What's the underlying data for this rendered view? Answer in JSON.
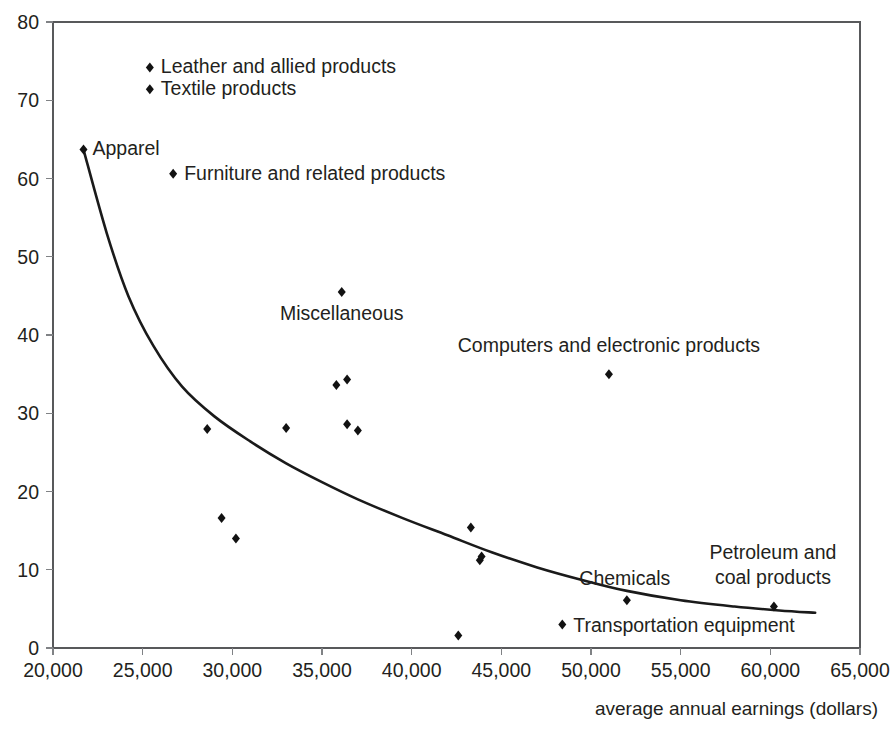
{
  "chart_data": {
    "type": "scatter",
    "title": "",
    "subtitle": "",
    "xlabel": "average annual earnings (dollars)",
    "ylabel": "",
    "xlim": [
      20000,
      65000
    ],
    "ylim": [
      0,
      80
    ],
    "xticks": [
      20000,
      25000,
      30000,
      35000,
      40000,
      45000,
      50000,
      55000,
      60000,
      65000
    ],
    "xtick_labels": [
      "20,000",
      "25,000",
      "30,000",
      "35,000",
      "40,000",
      "45,000",
      "50,000",
      "55,000",
      "60,000",
      "65,000"
    ],
    "yticks": [
      0,
      10,
      20,
      30,
      40,
      50,
      60,
      70,
      80
    ],
    "ytick_labels": [
      "0",
      "10",
      "20",
      "30",
      "40",
      "50",
      "60",
      "70",
      "80"
    ],
    "grid": false,
    "legend": false,
    "marker": "diamond",
    "marker_color": "#121212",
    "trendline": {
      "present": true,
      "color": "#1a1a1a",
      "style": "solid-decay-curve",
      "description": "smooth decreasing curve from upper-left to lower-right"
    },
    "points": [
      {
        "label": "Apparel",
        "x": 21700,
        "y": 63.7,
        "labeled": true
      },
      {
        "label": "Leather and allied products",
        "x": 25400,
        "y": 74.2,
        "labeled": true
      },
      {
        "label": "Textile products",
        "x": 25400,
        "y": 71.4,
        "labeled": true
      },
      {
        "label": "Furniture and related products",
        "x": 26700,
        "y": 60.6,
        "labeled": true
      },
      {
        "label": "Miscellaneous",
        "x": 36100,
        "y": 45.5,
        "labeled": true
      },
      {
        "label": "Computers and electronic products",
        "x": 51000,
        "y": 35.0,
        "labeled": true
      },
      {
        "label": "Chemicals",
        "x": 52000,
        "y": 6.1,
        "labeled": true
      },
      {
        "label": "Petroleum and coal products",
        "x": 60200,
        "y": 5.3,
        "labeled": true
      },
      {
        "label": "Transportation equipment",
        "x": 48400,
        "y": 3.0,
        "labeled": true
      },
      {
        "label": "",
        "x": 28600,
        "y": 28.0,
        "labeled": false
      },
      {
        "label": "",
        "x": 29400,
        "y": 16.6,
        "labeled": false
      },
      {
        "label": "",
        "x": 30200,
        "y": 14.0,
        "labeled": false
      },
      {
        "label": "",
        "x": 33000,
        "y": 28.1,
        "labeled": false
      },
      {
        "label": "",
        "x": 35800,
        "y": 33.6,
        "labeled": false
      },
      {
        "label": "",
        "x": 36400,
        "y": 34.3,
        "labeled": false
      },
      {
        "label": "",
        "x": 36400,
        "y": 28.6,
        "labeled": false
      },
      {
        "label": "",
        "x": 37000,
        "y": 27.8,
        "labeled": false
      },
      {
        "label": "",
        "x": 42600,
        "y": 1.6,
        "labeled": false
      },
      {
        "label": "",
        "x": 43300,
        "y": 15.4,
        "labeled": false
      },
      {
        "label": "",
        "x": 43800,
        "y": 11.2,
        "labeled": false
      },
      {
        "label": "",
        "x": 43900,
        "y": 11.7,
        "labeled": false
      }
    ],
    "annotations": [
      {
        "text": "Apparel",
        "anchor": "start",
        "at_x": 21700,
        "at_y": 63.7,
        "dx": 9,
        "dy": 5
      },
      {
        "text": "Leather and allied products",
        "anchor": "start",
        "at_x": 25400,
        "at_y": 74.2,
        "dx": 11,
        "dy": 6
      },
      {
        "text": "Textile products",
        "anchor": "start",
        "at_x": 25400,
        "at_y": 71.4,
        "dx": 11,
        "dy": 6
      },
      {
        "text": "Furniture and related products",
        "anchor": "start",
        "at_x": 26700,
        "at_y": 60.6,
        "dx": 11,
        "dy": 6
      },
      {
        "text": "Miscellaneous",
        "anchor": "middle",
        "at_x": 36100,
        "at_y": 45.5,
        "dx": 0,
        "dy": 28
      },
      {
        "text": "Computers and electronic products",
        "anchor": "middle",
        "at_x": 51000,
        "at_y": 35.0,
        "dx": 0,
        "dy": -22
      },
      {
        "text": "Chemicals",
        "anchor": "middle",
        "at_x": 52000,
        "at_y": 6.1,
        "dx": -2,
        "dy": -15
      },
      {
        "text": "Petroleum and",
        "anchor": "middle",
        "at_x": 60200,
        "at_y": 5.3,
        "dx": -1,
        "dy": -48
      },
      {
        "text": "coal products",
        "anchor": "middle",
        "at_x": 60200,
        "at_y": 5.3,
        "dx": -1,
        "dy": -23
      },
      {
        "text": "Transportation equipment",
        "anchor": "start",
        "at_x": 48400,
        "at_y": 3.0,
        "dx": 11,
        "dy": 7
      }
    ]
  },
  "axis": {
    "x_title": "average annual earnings (dollars)"
  }
}
